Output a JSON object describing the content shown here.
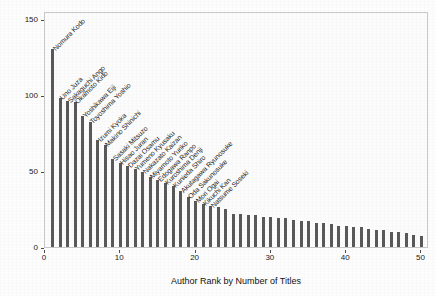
{
  "chart_data": {
    "type": "bar",
    "title": "",
    "xlabel": "Author Rank by Number of Titles",
    "ylabel": "Number of Titles",
    "xlim": [
      0,
      51
    ],
    "ylim": [
      0,
      155
    ],
    "xticks": [
      0,
      10,
      20,
      30,
      40,
      50
    ],
    "yticks": [
      0,
      50,
      100,
      150
    ],
    "grid": false,
    "legend": null,
    "bar_color": "#595959",
    "categories": [
      1,
      2,
      3,
      4,
      5,
      6,
      7,
      8,
      9,
      10,
      11,
      12,
      13,
      14,
      15,
      16,
      17,
      18,
      19,
      20,
      21,
      22,
      23,
      24,
      25,
      26,
      27,
      28,
      29,
      30,
      31,
      32,
      33,
      34,
      35,
      36,
      37,
      38,
      39,
      40,
      41,
      42,
      43,
      44,
      45,
      46,
      47,
      48,
      49,
      50
    ],
    "values": [
      130,
      98,
      96,
      95,
      86,
      82,
      70,
      67,
      58,
      55,
      53,
      51,
      49,
      46,
      44,
      42,
      40,
      37,
      33,
      30,
      28,
      27,
      26,
      25,
      22,
      22,
      21,
      21,
      20,
      20,
      19,
      19,
      18,
      17,
      17,
      16,
      16,
      15,
      14,
      14,
      13,
      13,
      12,
      11,
      11,
      10,
      10,
      9,
      8,
      7
    ],
    "point_labels": [
      "Nomura Kodo",
      "Uno Juza",
      "Sakaguchi Ango",
      "Okamoto Kido",
      "Yoshikawa Eiji",
      "Toyoshima Yoshio",
      "Izumi Kyoka",
      "Makino Shinichi",
      "Sasaki Mitsuzo",
      "Hisao Juran",
      "Dazai Osamu",
      "Yumeno Kyusaku",
      "Nakazato Kaizan",
      "Miyamoto Yuriko",
      "Edogawa Ranpo",
      "Kuroshima Denji",
      "Kunieda Shiro",
      "Akutagawa Ryunosuke",
      "Oda Sakunosuke",
      "Mori Ogai",
      "Kikuchi Kan",
      "Natsume Soseki"
    ]
  },
  "axes": {
    "y_tick_labels": [
      "0",
      "50",
      "100",
      "150"
    ],
    "x_tick_labels": [
      "0",
      "10",
      "20",
      "30",
      "40",
      "50"
    ],
    "y_axis_title": "Number of Titles",
    "x_axis_title": "Author Rank by Number of Titles"
  },
  "colors": {
    "bar": "#595959",
    "panel_background": "#fcfcfc",
    "panel_border": "#c9c9c9",
    "text": "#1a1a1a"
  }
}
